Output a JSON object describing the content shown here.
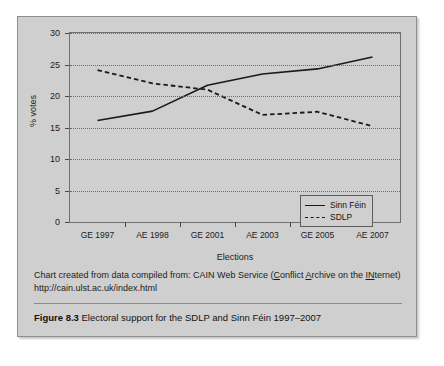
{
  "chart_data": {
    "type": "line",
    "title": "",
    "xlabel": "Elections",
    "ylabel": "% votes",
    "categories": [
      "GE 1997",
      "AE 1998",
      "GE 2001",
      "AE 2003",
      "GE 2005",
      "AE 2007"
    ],
    "series": [
      {
        "name": "Sinn Féin",
        "style": "solid",
        "values": [
          16.1,
          17.6,
          21.7,
          23.5,
          24.3,
          26.2
        ]
      },
      {
        "name": "SDLP",
        "style": "dashed",
        "values": [
          24.1,
          22.0,
          21.0,
          17.0,
          17.5,
          15.2
        ]
      }
    ],
    "ylim": [
      0,
      30
    ],
    "yticks": [
      0,
      5,
      10,
      15,
      20,
      25,
      30
    ],
    "grid": true,
    "legend_position": "bottom-right",
    "line_color": "#1a1a1a"
  },
  "axis": {
    "y_title": "% votes",
    "x_title": "Elections",
    "y_tick_labels": [
      "0",
      "5",
      "10",
      "15",
      "20",
      "25",
      "30"
    ],
    "x_tick_labels": [
      "GE 1997",
      "AE 1998",
      "GE 2001",
      "AE 2003",
      "GE 2005",
      "AE 2007"
    ]
  },
  "legend": {
    "items": [
      {
        "label": "Sinn Féin",
        "style": "solid"
      },
      {
        "label": "SDLP",
        "style": "dashed"
      }
    ]
  },
  "source_note": {
    "line1_a": "Chart created from data compiled from: CAIN Web Service (",
    "line1_u1": "C",
    "line1_b": "onflict ",
    "line1_u2": "A",
    "line1_c": "rchive",
    "line2_a": "on the ",
    "line2_u1": "IN",
    "line2_b": "ternet) http://cain.ulst.ac.uk/index.html"
  },
  "caption": {
    "label": "Figure 8.3",
    "text": "Electoral support for the SDLP and Sinn Féin 1997–2007"
  }
}
